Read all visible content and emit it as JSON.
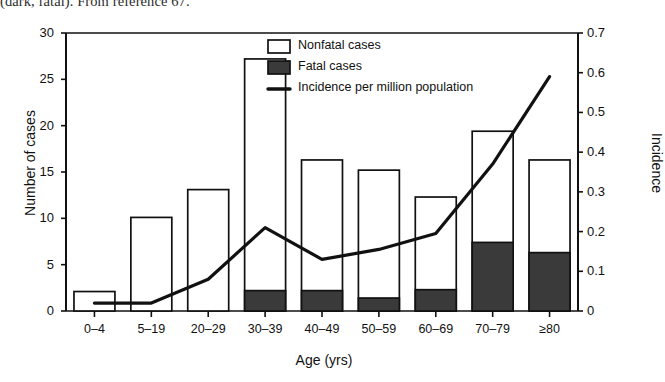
{
  "caption_fragment": "(dark, fatal). From reference 67.",
  "chart_data": {
    "type": "bar",
    "title": "",
    "subtitle": "",
    "xlabel": "Age (yrs)",
    "ylabel": "Number of cases",
    "y2label": "Incidence",
    "ylim": [
      0,
      30
    ],
    "y2lim": [
      0,
      0.7
    ],
    "yticks": [
      "0",
      "5",
      "10",
      "15",
      "20",
      "25",
      "30"
    ],
    "ytick_values": [
      0,
      5,
      10,
      15,
      20,
      25,
      30
    ],
    "y2ticks": [
      "0",
      "0.1",
      "0.2",
      "0.3",
      "0.4",
      "0.5",
      "0.6",
      "0.7"
    ],
    "y2tick_values": [
      0,
      0.1,
      0.2,
      0.3,
      0.4,
      0.5,
      0.6,
      0.7
    ],
    "grid": false,
    "legend_position": "top-center",
    "categories": [
      "0–4",
      "5–19",
      "20–29",
      "30–39",
      "40–49",
      "50–59",
      "60–69",
      "70–79",
      "≥80"
    ],
    "series": [
      {
        "name": "Nonfatal cases",
        "type": "bar-stacked",
        "color": "#ffffff",
        "edge_color": "#111111",
        "values": [
          2.1,
          10.1,
          13.1,
          25.0,
          14.1,
          13.8,
          10.0,
          12.0,
          10.0
        ]
      },
      {
        "name": "Fatal cases",
        "type": "bar-stacked",
        "color": "#3a3a3a",
        "edge_color": "#111111",
        "values": [
          0.0,
          0.0,
          0.0,
          2.2,
          2.2,
          1.4,
          2.3,
          7.4,
          6.3
        ]
      },
      {
        "name": "Incidence per million population",
        "type": "line",
        "color": "#111111",
        "axis": "right",
        "values": [
          0.02,
          0.02,
          0.08,
          0.21,
          0.13,
          0.155,
          0.195,
          0.37,
          0.59
        ]
      }
    ],
    "totals": [
      2.1,
      10.1,
      13.1,
      27.2,
      16.3,
      15.2,
      12.3,
      19.4,
      16.3
    ],
    "legend": [
      {
        "label": "Nonfatal cases",
        "marker": "open-square"
      },
      {
        "label": "Fatal cases",
        "marker": "filled-square"
      },
      {
        "label": "Incidence per million population",
        "marker": "line"
      }
    ]
  }
}
